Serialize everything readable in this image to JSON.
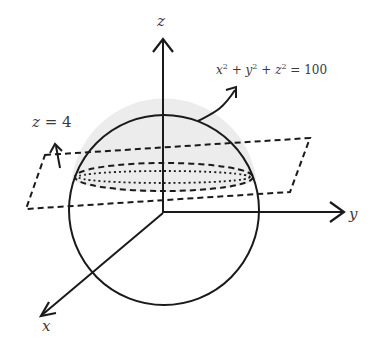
{
  "diagram": {
    "type": "3d-geometry-sketch",
    "colors": {
      "stroke": "#1a1a1a",
      "cap_fill": "#ececec",
      "label": "#3a3a3a",
      "background": "#ffffff"
    },
    "axes": {
      "z": {
        "label": "z"
      },
      "y": {
        "label": "y"
      },
      "x": {
        "label": "x"
      }
    },
    "sphere": {
      "equation_lhs": "x",
      "equation_parts": [
        "x",
        "2",
        " + ",
        "y",
        "2",
        " + ",
        "z",
        "2",
        " = ",
        "100"
      ],
      "equation_text": "x² + y² + z² = 100"
    },
    "plane": {
      "label_var": "z",
      "label_eq": " = ",
      "label_val": "4",
      "label_text": "z = 4"
    }
  }
}
